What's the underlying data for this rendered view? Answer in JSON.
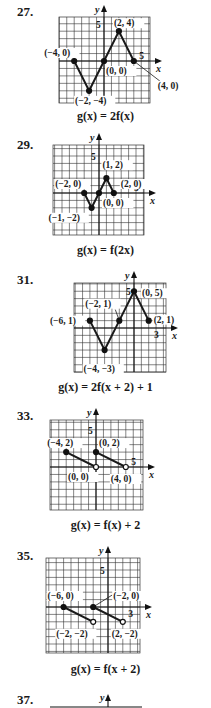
{
  "problems": [
    {
      "number": "27.",
      "caption": "g(x) = 2f(x)",
      "grid": {
        "left": 59,
        "right": 150,
        "top": 17,
        "bottom": 103,
        "ox": 104,
        "oy": 61,
        "unit": 7.45
      },
      "tick_labels": {
        "x": "5",
        "y": "5"
      },
      "polyline": [
        [
          -4,
          0
        ],
        [
          -2,
          -4
        ],
        [
          0,
          0
        ],
        [
          2,
          4
        ],
        [
          4,
          0
        ]
      ],
      "points": [
        {
          "label": "(−4, 0)",
          "x": -4,
          "y": 0,
          "filled": true
        },
        {
          "label": "(−2, −4)",
          "x": -2,
          "y": -4,
          "filled": true
        },
        {
          "label": "(0, 0)",
          "x": 0,
          "y": 0,
          "filled": true
        },
        {
          "label": "(2, 4)",
          "x": 2,
          "y": 4,
          "filled": true
        },
        {
          "label": "(4, 0)",
          "x": 4,
          "y": 0,
          "filled": true
        }
      ]
    },
    {
      "number": "29.",
      "caption": "g(x) = f(2x)",
      "grid": {
        "left": 53,
        "right": 144,
        "top": 145,
        "bottom": 235,
        "ox": 99,
        "oy": 193,
        "unit": 7.4
      },
      "tick_labels": {
        "x": "5",
        "y": "5"
      },
      "polyline": [
        [
          -2,
          0
        ],
        [
          -1,
          -2
        ],
        [
          0,
          0
        ],
        [
          1,
          2
        ],
        [
          2,
          0
        ]
      ],
      "points": [
        {
          "label": "(−2, 0)",
          "x": -2,
          "y": 0,
          "filled": true
        },
        {
          "label": "(−1, −2)",
          "x": -1,
          "y": -2,
          "filled": true
        },
        {
          "label": "(0, 0)",
          "x": 0,
          "y": 0,
          "filled": true
        },
        {
          "label": "(1, 2)",
          "x": 1,
          "y": 2,
          "filled": true
        },
        {
          "label": "(2, 0)",
          "x": 2,
          "y": 0,
          "filled": true
        }
      ]
    },
    {
      "number": "31.",
      "caption": "g(x) = 2f(x + 2) + 1",
      "grid": {
        "left": 74,
        "right": 166,
        "top": 283,
        "bottom": 372,
        "ox": 134,
        "oy": 328,
        "unit": 7.35
      },
      "tick_labels": {
        "x": "3",
        "y": "5"
      },
      "polyline": [
        [
          -6,
          1
        ],
        [
          -4,
          -3
        ],
        [
          -2,
          1
        ],
        [
          0,
          5
        ],
        [
          2,
          1
        ]
      ],
      "points": [
        {
          "label": "(−6, 1)",
          "x": -6,
          "y": 1,
          "filled": true
        },
        {
          "label": "(−4, −3)",
          "x": -4,
          "y": -3,
          "filled": true
        },
        {
          "label": "(−2, 1)",
          "x": -2,
          "y": 1,
          "filled": true
        },
        {
          "label": "(0, 5)",
          "x": 0,
          "y": 5,
          "filled": true
        },
        {
          "label": "(2, 1)",
          "x": 2,
          "y": 1,
          "filled": true
        }
      ]
    },
    {
      "number": "33.",
      "caption": "g(x) = f(x) + 2",
      "grid": {
        "left": 50,
        "right": 143,
        "top": 420,
        "bottom": 510,
        "ox": 96,
        "oy": 467,
        "unit": 7.45
      },
      "tick_labels": {
        "x": "5",
        "y": "5"
      },
      "segments": [
        [
          [
            -4,
            2
          ],
          [
            0,
            0
          ]
        ],
        [
          [
            0,
            2
          ],
          [
            4,
            0
          ]
        ]
      ],
      "points": [
        {
          "label": "(−4, 2)",
          "x": -4,
          "y": 2,
          "filled": true
        },
        {
          "label": "(0, 0)",
          "x": 0,
          "y": 0,
          "filled": false
        },
        {
          "label": "(0, 2)",
          "x": 0,
          "y": 2,
          "filled": true
        },
        {
          "label": "(4, 0)",
          "x": 4,
          "y": 0,
          "filled": false
        }
      ]
    },
    {
      "number": "35.",
      "caption": "g(x) = f(x + 2)",
      "grid": {
        "left": 46,
        "right": 140,
        "top": 558,
        "bottom": 653,
        "ox": 108,
        "oy": 607,
        "unit": 7.4
      },
      "tick_labels": {
        "x": "3",
        "y": "5"
      },
      "segments": [
        [
          [
            -6,
            0
          ],
          [
            -2,
            -2
          ]
        ],
        [
          [
            -2,
            0
          ],
          [
            2,
            -2
          ]
        ]
      ],
      "points": [
        {
          "label": "(−6, 0)",
          "x": -6,
          "y": 0,
          "filled": true
        },
        {
          "label": "(−2, −2)",
          "x": -2,
          "y": -2,
          "filled": false
        },
        {
          "label": "(−2, 0)",
          "x": -2,
          "y": 0,
          "filled": true
        },
        {
          "label": "(2, −2)",
          "x": 2,
          "y": -2,
          "filled": false
        }
      ]
    },
    {
      "number": "37."
    }
  ],
  "axis_labels": {
    "x": "x",
    "y": "y"
  }
}
